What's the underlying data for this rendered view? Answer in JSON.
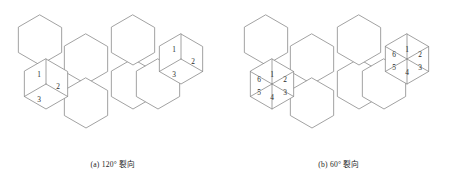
{
  "figure": {
    "background_color": "#ffffff",
    "line_color": "#8a8a8a",
    "text_color": "#2b2b2b",
    "panels": [
      {
        "id": "a",
        "caption": "(a) 120° 裂向",
        "crack_angle_label": "120°",
        "split_type": "rhombus",
        "sectors_per_cell": 3,
        "split_cells": [
          {
            "name": "left-split-hexagon",
            "center_x": 46,
            "center_y": 84,
            "labels": [
              "1",
              "2",
              "3"
            ],
            "label_positions": [
              {
                "x": 39,
                "y": 74
              },
              {
                "x": 58,
                "y": 86
              },
              {
                "x": 39,
                "y": 99
              }
            ]
          },
          {
            "name": "right-split-hexagon",
            "center_x": 181,
            "center_y": 59,
            "labels": [
              "1",
              "2",
              "3"
            ],
            "label_positions": [
              {
                "x": 174,
                "y": 49
              },
              {
                "x": 193,
                "y": 61
              },
              {
                "x": 174,
                "y": 74
              }
            ]
          }
        ]
      },
      {
        "id": "b",
        "caption": "(b) 60° 裂向",
        "crack_angle_label": "60°",
        "split_type": "triangle",
        "sectors_per_cell": 6,
        "split_cells": [
          {
            "name": "left-split-hexagon",
            "center_x": 46,
            "center_y": 84,
            "labels": [
              "1",
              "2",
              "3",
              "4",
              "5",
              "6"
            ],
            "label_positions": [
              {
                "x": 46,
                "y": 74
              },
              {
                "x": 59,
                "y": 79
              },
              {
                "x": 59,
                "y": 92
              },
              {
                "x": 46,
                "y": 97
              },
              {
                "x": 33,
                "y": 92
              },
              {
                "x": 33,
                "y": 79
              }
            ]
          },
          {
            "name": "right-split-hexagon",
            "center_x": 181,
            "center_y": 59,
            "labels": [
              "1",
              "2",
              "3",
              "4",
              "5",
              "6"
            ],
            "label_positions": [
              {
                "x": 181,
                "y": 49
              },
              {
                "x": 194,
                "y": 54
              },
              {
                "x": 194,
                "y": 67
              },
              {
                "x": 181,
                "y": 72
              },
              {
                "x": 168,
                "y": 67
              },
              {
                "x": 168,
                "y": 54
              }
            ]
          }
        ]
      }
    ],
    "lattice": {
      "hex_radius": 25,
      "plain_cells": [
        {
          "name": "hex-top-left",
          "cx": 40,
          "cy": 40
        },
        {
          "name": "hex-upper-mid",
          "cx": 86,
          "cy": 59
        },
        {
          "name": "hex-lower-mid",
          "cx": 86,
          "cy": 103
        },
        {
          "name": "hex-center",
          "cx": 133,
          "cy": 84
        },
        {
          "name": "hex-right-upper",
          "cx": 133,
          "cy": 40
        },
        {
          "name": "hex-bridge",
          "cx": 158,
          "cy": 84
        }
      ]
    }
  }
}
